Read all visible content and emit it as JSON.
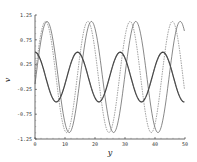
{
  "chart_data": {
    "type": "line",
    "title": "",
    "xlabel": "y",
    "ylabel": "v",
    "xlim": [
      0,
      50
    ],
    "ylim": [
      -1.25,
      1.25
    ],
    "xticks": [
      0,
      10,
      20,
      30,
      40,
      50
    ],
    "yticks": [
      1.25,
      0.75,
      0.25,
      -0.25,
      -0.75,
      -1.25
    ],
    "xtick_labels": [
      "0",
      "10",
      "20",
      "30",
      "40",
      "50"
    ],
    "ytick_labels": [
      "1.25",
      "0.75",
      "0.25",
      "-0.25",
      "-0.75",
      "-1.25"
    ],
    "grid": false,
    "legend": null,
    "series": [
      {
        "name": "large-amplitude solid",
        "style": "solid",
        "amplitude": 1.12,
        "period": 14.8,
        "peaks_x": [
          4.0,
          18.7,
          33.5,
          48.5
        ],
        "troughs_x": [
          11.3,
          26.0,
          41.0
        ]
      },
      {
        "name": "large-amplitude dashed",
        "style": "dashed",
        "amplitude": 1.12,
        "period": 14.1,
        "peaks_x": [
          3.5,
          17.7,
          31.8,
          46.0
        ],
        "troughs_x": [
          10.5,
          24.8,
          39.0
        ]
      },
      {
        "name": "small-amplitude solid (bold)",
        "style": "bold",
        "amplitude": 0.5,
        "period": 14.2,
        "peaks_x": [
          0,
          14.4,
          28.6,
          42.8
        ],
        "troughs_x": [
          7.2,
          21.5,
          35.7,
          49.9
        ]
      },
      {
        "name": "small-amplitude dotted",
        "style": "dotted",
        "amplitude": 0.5,
        "period": 14.2,
        "peaks_x": [
          0,
          14.4,
          28.6,
          42.8
        ],
        "troughs_x": [
          7.2,
          21.5,
          35.7,
          49.9
        ]
      }
    ]
  }
}
